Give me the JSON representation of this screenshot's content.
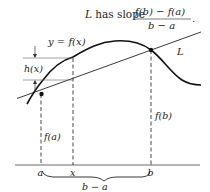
{
  "diagram": {
    "caption": {
      "prefix_var": "L",
      "prefix_text": " has slope ",
      "numerator": "f(b) − f(a)",
      "denominator": "b − a",
      "suffix": "."
    },
    "curve_label": "y = f(x)",
    "line_label": "L",
    "gap_label": "h(x)",
    "vertical_labels": {
      "fa": "f(a)",
      "fb": "f(b)"
    },
    "axis_ticks": {
      "a": "a",
      "x": "x",
      "b": "b"
    },
    "brace_label": "b − a",
    "colors": {
      "ink": "#222222",
      "background": "#ffffff"
    }
  }
}
